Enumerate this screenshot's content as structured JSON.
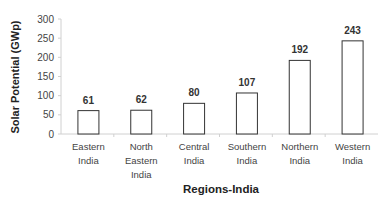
{
  "chart_data": {
    "type": "bar",
    "title": "",
    "xlabel": "Regions-India",
    "ylabel": "Solar Potential (GWp)",
    "ylim": [
      0,
      300
    ],
    "yticks": [
      0,
      50,
      100,
      150,
      200,
      250,
      300
    ],
    "grid": false,
    "legend": null,
    "categories": [
      "Eastern India",
      "North Eastern India",
      "Central India",
      "Southern India",
      "Northern India",
      "Western India"
    ],
    "category_lines": [
      [
        "Eastern",
        "India"
      ],
      [
        "North",
        "Eastern",
        "India"
      ],
      [
        "Central",
        "India"
      ],
      [
        "Southern",
        "India"
      ],
      [
        "Northern",
        "India"
      ],
      [
        "Western",
        "India"
      ]
    ],
    "values": [
      61,
      62,
      80,
      107,
      192,
      243
    ],
    "data_labels": [
      "61",
      "62",
      "80",
      "107",
      "192",
      "243"
    ],
    "bar_fill": "#ffffff",
    "bar_stroke": "#333333"
  }
}
